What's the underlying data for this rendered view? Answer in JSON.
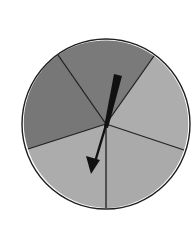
{
  "diagram": {
    "type": "spinner",
    "sector_count": 5,
    "center": [
      106,
      124
    ],
    "radius": 84,
    "outline_color": "#1e1e1e",
    "colors": {
      "dark": "#7a7a7a",
      "light": "#adadad"
    },
    "sectors": [
      {
        "name": "top",
        "shade": "dark"
      },
      {
        "name": "upper-right",
        "shade": "light"
      },
      {
        "name": "lower-right",
        "shade": "light"
      },
      {
        "name": "lower-left",
        "shade": "light"
      },
      {
        "name": "upper-left",
        "shade": "dark"
      }
    ],
    "boundary_points": [
      [
        58,
        55
      ],
      [
        154,
        56
      ],
      [
        184,
        150
      ],
      [
        106,
        210
      ],
      [
        28,
        149
      ]
    ],
    "arrow": {
      "tail": [
        118,
        75
      ],
      "tip": [
        92,
        172
      ],
      "color": "#111111"
    }
  }
}
